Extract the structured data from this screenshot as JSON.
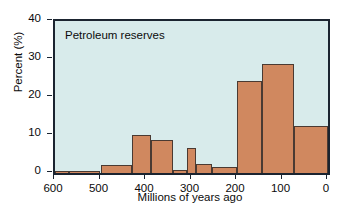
{
  "chart_data": {
    "type": "bar",
    "title": "Petroleum reserves",
    "xlabel": "Millions of years ago",
    "ylabel": "Percent (%)",
    "xlim": [
      600,
      0
    ],
    "ylim": [
      0,
      40
    ],
    "x_reversed": true,
    "grid": false,
    "legend": null,
    "xticks": [
      600,
      500,
      400,
      300,
      200,
      100,
      0
    ],
    "yticks": [
      0,
      10,
      20,
      30,
      40
    ],
    "colors": {
      "bar_fill": "#d0885f",
      "bar_edge": "#4a3a32",
      "plot_background": "#d8ebeb",
      "axis": "#1b2430",
      "text": "#0b0b0b"
    },
    "bins": [
      {
        "start": 600,
        "end": 570,
        "value": 0.5
      },
      {
        "start": 570,
        "end": 500,
        "value": 0.5
      },
      {
        "start": 500,
        "end": 430,
        "value": 2.0
      },
      {
        "start": 430,
        "end": 390,
        "value": 10.0
      },
      {
        "start": 390,
        "end": 340,
        "value": 8.8
      },
      {
        "start": 340,
        "end": 310,
        "value": 0.8
      },
      {
        "start": 310,
        "end": 290,
        "value": 6.5
      },
      {
        "start": 290,
        "end": 255,
        "value": 2.5
      },
      {
        "start": 255,
        "end": 200,
        "value": 1.6
      },
      {
        "start": 200,
        "end": 145,
        "value": 24.2
      },
      {
        "start": 145,
        "end": 75,
        "value": 28.8
      },
      {
        "start": 75,
        "end": 0,
        "value": 12.5
      }
    ]
  }
}
